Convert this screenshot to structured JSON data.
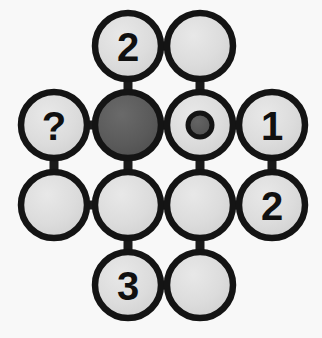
{
  "figure": {
    "background_color": "#f8f8f8",
    "outline_color": "#141414",
    "edge_color": "#1a1a1a",
    "fill_light": "#dcdcdc",
    "fill_dark": "#5a5a5a",
    "label_color": "#101010",
    "node_radius": 33,
    "dot_radius": 12,
    "columns_x": [
      54,
      128,
      200,
      272
    ],
    "rows_y": [
      46,
      125,
      205,
      285
    ]
  },
  "nodes": [
    {
      "id": "r1c2",
      "label": "2",
      "cx": 128,
      "cy": 46,
      "fill": "light",
      "marker": "none",
      "name": "node-r1c2-two"
    },
    {
      "id": "r1c3",
      "label": "",
      "cx": 200,
      "cy": 46,
      "fill": "light",
      "marker": "none",
      "name": "node-r1c3-empty"
    },
    {
      "id": "r2c1",
      "label": "?",
      "cx": 54,
      "cy": 125,
      "fill": "light",
      "marker": "none",
      "name": "node-r2c1-question"
    },
    {
      "id": "r2c2",
      "label": "",
      "cx": 128,
      "cy": 125,
      "fill": "dark",
      "marker": "none",
      "name": "node-r2c2-filled-dark"
    },
    {
      "id": "r2c3",
      "label": "",
      "cx": 200,
      "cy": 125,
      "fill": "light",
      "marker": "dot",
      "name": "node-r2c3-dot"
    },
    {
      "id": "r2c4",
      "label": "1",
      "cx": 272,
      "cy": 125,
      "fill": "light",
      "marker": "none",
      "name": "node-r2c4-one"
    },
    {
      "id": "r3c1",
      "label": "",
      "cx": 54,
      "cy": 205,
      "fill": "light",
      "marker": "none",
      "name": "node-r3c1-empty"
    },
    {
      "id": "r3c2",
      "label": "",
      "cx": 128,
      "cy": 205,
      "fill": "light",
      "marker": "none",
      "name": "node-r3c2-empty"
    },
    {
      "id": "r3c3",
      "label": "",
      "cx": 200,
      "cy": 205,
      "fill": "light",
      "marker": "none",
      "name": "node-r3c3-empty"
    },
    {
      "id": "r3c4",
      "label": "2",
      "cx": 272,
      "cy": 205,
      "fill": "light",
      "marker": "none",
      "name": "node-r3c4-two"
    },
    {
      "id": "r4c2",
      "label": "3",
      "cx": 128,
      "cy": 285,
      "fill": "light",
      "marker": "none",
      "name": "node-r4c2-three"
    },
    {
      "id": "r4c3",
      "label": "",
      "cx": 200,
      "cy": 285,
      "fill": "light",
      "marker": "none",
      "name": "node-r4c3-empty"
    }
  ],
  "edges": [
    {
      "from": "r1c2",
      "to": "r1c3",
      "orientation": "horizontal"
    },
    {
      "from": "r2c1",
      "to": "r2c2",
      "orientation": "horizontal"
    },
    {
      "from": "r2c2",
      "to": "r2c3",
      "orientation": "horizontal"
    },
    {
      "from": "r2c3",
      "to": "r2c4",
      "orientation": "horizontal"
    },
    {
      "from": "r3c1",
      "to": "r3c2",
      "orientation": "horizontal"
    },
    {
      "from": "r3c2",
      "to": "r3c3",
      "orientation": "horizontal"
    },
    {
      "from": "r3c3",
      "to": "r3c4",
      "orientation": "horizontal"
    },
    {
      "from": "r4c2",
      "to": "r4c3",
      "orientation": "horizontal"
    },
    {
      "from": "r1c2",
      "to": "r2c2",
      "orientation": "vertical"
    },
    {
      "from": "r1c3",
      "to": "r2c3",
      "orientation": "vertical"
    },
    {
      "from": "r2c1",
      "to": "r3c1",
      "orientation": "vertical"
    },
    {
      "from": "r2c2",
      "to": "r3c2",
      "orientation": "vertical"
    },
    {
      "from": "r2c3",
      "to": "r3c3",
      "orientation": "vertical"
    },
    {
      "from": "r2c4",
      "to": "r3c4",
      "orientation": "vertical"
    },
    {
      "from": "r3c2",
      "to": "r4c2",
      "orientation": "vertical"
    },
    {
      "from": "r3c3",
      "to": "r4c3",
      "orientation": "vertical"
    }
  ]
}
